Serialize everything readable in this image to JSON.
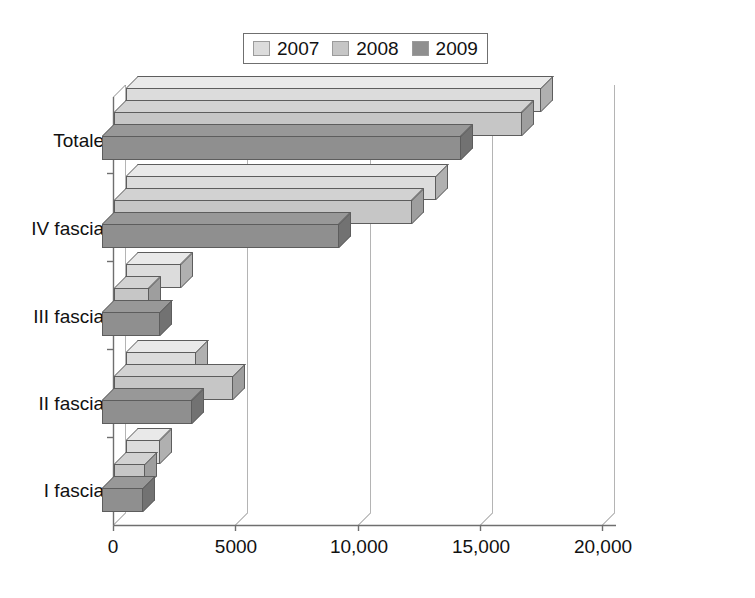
{
  "chart_data": {
    "type": "bar",
    "orientation": "horizontal",
    "title": "",
    "xlabel": "",
    "ylabel": "",
    "categories": [
      "I fascia",
      "II fascia",
      "III fascia",
      "IV fascia",
      "Totale"
    ],
    "series": [
      {
        "name": "2007",
        "color": "#dcdcdc",
        "values": [
          1400,
          2900,
          2250,
          12700,
          17000
        ]
      },
      {
        "name": "2008",
        "color": "#c6c6c6",
        "values": [
          1300,
          4900,
          1450,
          12200,
          16700
        ]
      },
      {
        "name": "2009",
        "color": "#8f8f8f",
        "values": [
          1700,
          3700,
          2400,
          9700,
          14700
        ]
      }
    ],
    "xticks": [
      {
        "value": 0,
        "label": "0"
      },
      {
        "value": 5000,
        "label": "5000"
      },
      {
        "value": 10000,
        "label": "10,000"
      },
      {
        "value": 15000,
        "label": "15,000"
      },
      {
        "value": 20000,
        "label": "20,000"
      }
    ],
    "xlim": [
      0,
      20000
    ],
    "grid": "vertical",
    "legend_position": "top-center",
    "legend_entries": [
      "2007",
      "2008",
      "2009"
    ]
  },
  "legend": {
    "items": [
      {
        "label": "2007"
      },
      {
        "label": "2008"
      },
      {
        "label": "2009"
      }
    ]
  },
  "axes": {
    "y_categories": [
      {
        "label": "Totale"
      },
      {
        "label": "IV fascia"
      },
      {
        "label": "III fascia"
      },
      {
        "label": "II fascia"
      },
      {
        "label": "I fascia"
      }
    ],
    "x_tick_labels": [
      "0",
      "5000",
      "10,000",
      "15,000",
      "20,000"
    ]
  },
  "colors": {
    "series_2007": "#dcdcdc",
    "series_2008": "#c6c6c6",
    "series_2009": "#8f8f8f",
    "axis": "#6f6f6f",
    "grid": "#b4b4b4",
    "text": "#111111",
    "background": "#ffffff"
  }
}
